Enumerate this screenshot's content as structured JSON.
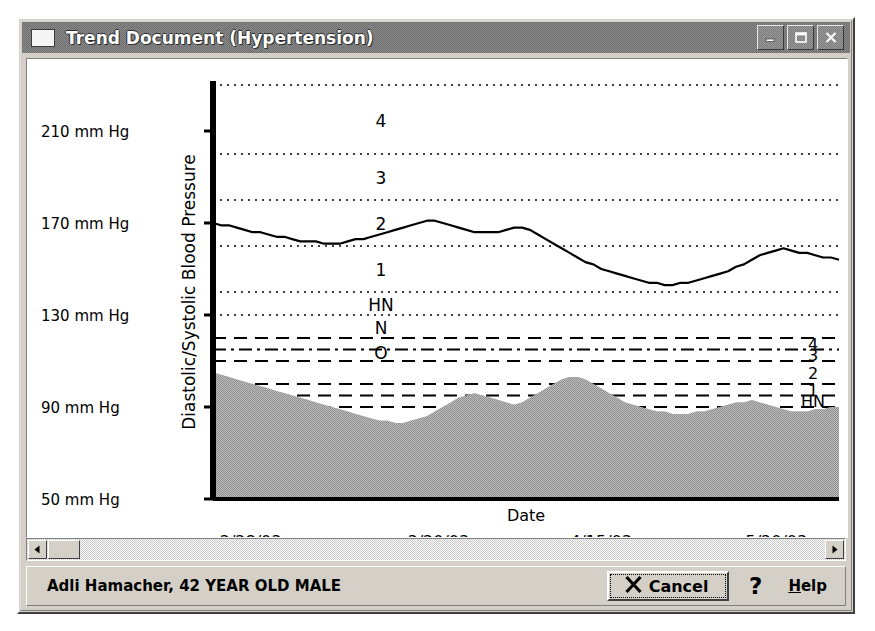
{
  "window": {
    "title": "Trend Document (Hypertension)",
    "icon": "document-icon",
    "controls": {
      "minimize": "minimize-icon",
      "maximize": "maximize-icon",
      "close": "close-icon"
    }
  },
  "statusbar": {
    "patient": "Adli Hamacher, 42 YEAR OLD MALE",
    "cancel_label": "Cancel",
    "cancel_icon": "x-icon",
    "help_icon": "question-mark-icon",
    "help_label_prefix": "H",
    "help_label_rest": "elp"
  },
  "scrollbar": {
    "left_arrow": "arrow-left-icon",
    "right_arrow": "arrow-right-icon",
    "thumb_position": "start"
  },
  "colors": {
    "window_face": "#d4d0c8",
    "titlebar": "#7a7a7a",
    "plot_background": "#ffffff",
    "diastolic_fill": "#a8a8a8",
    "line": "#000000",
    "gridline": "#000000"
  },
  "chart_data": {
    "type": "line",
    "title": "",
    "xlabel": "Date",
    "ylabel": "Diastolic/Systolic Blood Pressure",
    "ylim": [
      50,
      230
    ],
    "yticks": [
      210,
      170,
      130,
      90,
      50
    ],
    "ytick_labels": [
      "210 mm Hg",
      "170 mm Hg",
      "130 mm Hg",
      "90 mm Hg",
      "50 mm Hg"
    ],
    "xtick_labels": [
      "2/28/03",
      "3/20/03",
      "4/15/03",
      "5/20/03"
    ],
    "xtick_positions": [
      0.06,
      0.36,
      0.62,
      0.9
    ],
    "grid": true,
    "legend_position": "inline-zone-labels",
    "zone_labels_left": [
      "4",
      "3",
      "2",
      "1",
      "HN",
      "N",
      "O"
    ],
    "zone_labels_right": [
      "4",
      "3",
      "2",
      "1",
      "HN",
      "N",
      "O"
    ],
    "systolic_zone_boundaries": [
      {
        "label": "4",
        "value": 230,
        "style": "dotted"
      },
      {
        "label": "3",
        "value": 200,
        "style": "dotted"
      },
      {
        "label": "2",
        "value": 180,
        "style": "dotted"
      },
      {
        "label": "1",
        "value": 160,
        "style": "dotted"
      },
      {
        "label": "HN",
        "value": 140,
        "style": "dotted"
      },
      {
        "label": "N",
        "value": 130,
        "style": "dotted"
      },
      {
        "label": "O",
        "value": 120,
        "style": "dashed"
      }
    ],
    "diastolic_zone_boundaries": [
      {
        "label": "4",
        "value": 120,
        "style": "dashed"
      },
      {
        "label": "3",
        "value": 115,
        "style": "dashdot"
      },
      {
        "label": "2",
        "value": 110,
        "style": "dashed"
      },
      {
        "label": "1",
        "value": 100,
        "style": "dashed"
      },
      {
        "label": "HN",
        "value": 95,
        "style": "dashed"
      },
      {
        "label": "N",
        "value": 90,
        "style": "dashed"
      },
      {
        "label": "O",
        "value": 72,
        "style": "dashed"
      }
    ],
    "series": [
      {
        "name": "Systolic Blood Pressure",
        "style": "line",
        "values": [
          170,
          169,
          169,
          168,
          167,
          166,
          166,
          165,
          164,
          164,
          163,
          162,
          162,
          162,
          161,
          161,
          161,
          162,
          163,
          163,
          164,
          165,
          166,
          167,
          168,
          169,
          170,
          171,
          171,
          170,
          169,
          168,
          167,
          166,
          166,
          166,
          166,
          167,
          168,
          168,
          167,
          165,
          163,
          161,
          159,
          157,
          155,
          153,
          152,
          150,
          149,
          148,
          147,
          146,
          145,
          144,
          144,
          143,
          143,
          144,
          144,
          145,
          146,
          147,
          148,
          149,
          151,
          152,
          154,
          156,
          157,
          158,
          159,
          158,
          157,
          157,
          156,
          155,
          155,
          154
        ]
      },
      {
        "name": "Diastolic Blood Pressure",
        "style": "area",
        "values": [
          105,
          104,
          103,
          102,
          101,
          100,
          99,
          98,
          97,
          96,
          95,
          94,
          93,
          92,
          91,
          90,
          89,
          88,
          87,
          86,
          85,
          84,
          84,
          83,
          83,
          84,
          85,
          86,
          88,
          90,
          92,
          94,
          95,
          96,
          95,
          94,
          93,
          92,
          91,
          92,
          94,
          96,
          98,
          100,
          102,
          103,
          103,
          102,
          100,
          98,
          96,
          94,
          92,
          91,
          90,
          89,
          88,
          88,
          87,
          87,
          87,
          88,
          88,
          89,
          90,
          91,
          92,
          92,
          93,
          92,
          91,
          90,
          89,
          88,
          88,
          88,
          89,
          89,
          90,
          90
        ]
      }
    ]
  }
}
